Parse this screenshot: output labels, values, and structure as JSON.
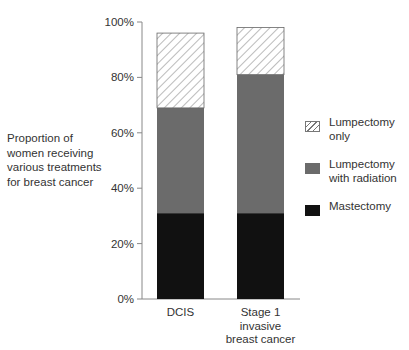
{
  "chart_data": {
    "type": "bar",
    "stacked": true,
    "title": "",
    "xlabel": "",
    "ylabel": "Proportion of women receiving various treatments for breast cancer",
    "ylim": [
      0,
      100
    ],
    "yticks": [
      "0%",
      "20%",
      "40%",
      "60%",
      "80%",
      "100%"
    ],
    "categories": [
      "DCIS",
      "Stage 1 invasive breast cancer"
    ],
    "category_label_lines": [
      [
        "DCIS"
      ],
      [
        "Stage 1",
        "invasive",
        "breast cancer"
      ]
    ],
    "series": [
      {
        "name": "Mastectomy",
        "values": [
          31,
          31
        ],
        "color": "#111111",
        "pattern": "solid"
      },
      {
        "name": "Lumpectomy with radiation",
        "values": [
          38,
          50
        ],
        "color": "#6b6b6b",
        "pattern": "solid"
      },
      {
        "name": "Lumpectomy only",
        "values": [
          27,
          17
        ],
        "color": "#ffffff",
        "pattern": "hatch"
      }
    ],
    "grid": false,
    "legend_position": "right"
  },
  "ylabel_lines": [
    "Proportion of",
    "women receiving",
    "various treatments",
    "for breast cancer"
  ],
  "legend": [
    {
      "label_lines": [
        "Lumpectomy",
        "only"
      ],
      "pattern": "hatch"
    },
    {
      "label_lines": [
        "Lumpectomy",
        "with radiation"
      ],
      "color": "#6b6b6b"
    },
    {
      "label_lines": [
        "Mastectomy"
      ],
      "color": "#111111"
    }
  ],
  "colors": {
    "axis": "#888888",
    "text": "#333333"
  }
}
